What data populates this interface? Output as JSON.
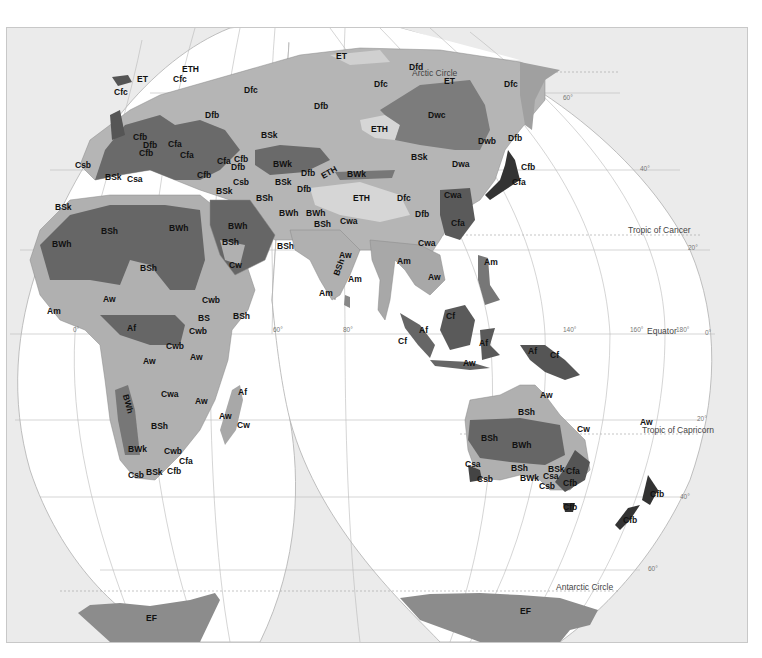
{
  "map": {
    "title": "World climate regions (Köppen classification) — Eastern Hemisphere interrupted projection",
    "colors": {
      "background": "#ebebeb",
      "ocean": "#ffffff",
      "zone_light": "#c9c9c9",
      "zone_mid": "#a9a9a9",
      "zone_dark": "#6e6e6e",
      "zone_darker": "#555555",
      "ice": "#8c8c8c",
      "graticule": "#b8b8b8"
    },
    "reference_lines": {
      "arctic_circle": "Arctic Circle",
      "tropic_of_cancer": "Tropic of Cancer",
      "equator": "Equator",
      "tropic_of_capricorn": "Tropic of Capricorn",
      "antarctic_circle": "Antarctic Circle"
    },
    "degree_labels": {
      "lat_60n": "60°",
      "lat_40n": "40°",
      "lat_20n": "20°",
      "lat_0": "0°",
      "lat_20s": "20°",
      "lat_40s": "40°",
      "lat_60s": "60°",
      "lon_0": "0°",
      "lon_60": "60°",
      "lon_80": "80°",
      "lon_140": "140°",
      "lon_160": "160°",
      "lon_180": "180°"
    },
    "regions": {
      "europe": [
        "ET",
        "ETH",
        "Cfc",
        "Cfc",
        "Dfc",
        "Dfb",
        "Cfb",
        "Dfb",
        "Cfa",
        "Cfa",
        "Cfb",
        "Csb",
        "BSk",
        "Csa",
        "Cfa",
        "Cfb",
        "Dfb",
        "Cfb",
        "Csb",
        "BSk"
      ],
      "north_asia": [
        "ET",
        "Arctic Circle",
        "Dfd",
        "Dfc",
        "ET",
        "Dfc",
        "Dfb",
        "Dwc",
        "ETH",
        "Dwb",
        "Dfb",
        "BSk",
        "BSk",
        "BWk",
        "Dfb",
        "ETH",
        "BWk",
        "BSk",
        "Dfb",
        "Dwa",
        "Cfb",
        "Cfa"
      ],
      "south_asia": [
        "BSh",
        "BWh",
        "BWh",
        "BSh",
        "Cwa",
        "ETH",
        "Dfc",
        "Dfb",
        "Cwa",
        "Cfa",
        "Cwa",
        "Aw",
        "BSh",
        "Am",
        "Am",
        "Am",
        "Aw",
        "Am",
        "Cf",
        "Af",
        "Cf",
        "Af",
        "Aw",
        "Af",
        "Cf"
      ],
      "africa_middle_east": [
        "BSk",
        "BSh",
        "BWh",
        "BWh",
        "BSh",
        "BWh",
        "BSh",
        "Cw",
        "BSh",
        "Aw",
        "Am",
        "Cwb",
        "BS",
        "BSh",
        "Af",
        "Cwb",
        "Cwb",
        "Aw",
        "Aw",
        "Cwa",
        "Aw",
        "BWh",
        "BSh",
        "BWk",
        "Cwb",
        "Cfa",
        "BSk",
        "Cfb",
        "Csb",
        "Aw",
        "Af",
        "Cw"
      ],
      "oceania": [
        "Aw",
        "BSh",
        "Cw",
        "BSh",
        "BWh",
        "BSh",
        "Csa",
        "Csb",
        "BWk",
        "BSk",
        "Csa",
        "Csb",
        "Cfa",
        "Cfb",
        "Cfb",
        "Aw",
        "Cfb",
        "Cfb"
      ],
      "antarctica": [
        "EF",
        "EF"
      ]
    }
  }
}
